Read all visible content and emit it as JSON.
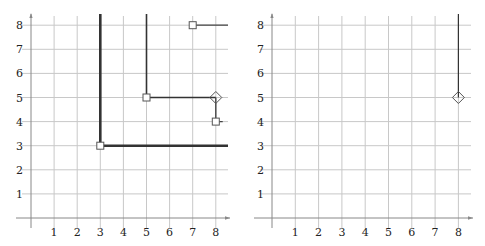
{
  "panels": [
    {
      "id": "left",
      "origin_px": [
        31,
        218
      ],
      "unit_px": [
        23.1,
        24.1
      ],
      "x_extent_px": [
        20,
        228
      ],
      "y_extent_px": [
        14,
        228
      ],
      "x_ticks": [
        "1",
        "2",
        "3",
        "4",
        "5",
        "6",
        "7",
        "8"
      ],
      "y_ticks": [
        "1",
        "2",
        "3",
        "4",
        "5",
        "6",
        "7",
        "8"
      ],
      "grid": {
        "xmax": 8.5,
        "ymax": 8.5
      },
      "paths": [
        {
          "name": "thick-corner-path-3-3",
          "points": [
            [
              3,
              8.5
            ],
            [
              3,
              3
            ],
            [
              8.5,
              3
            ]
          ],
          "width": 2.6,
          "color": "#333333"
        },
        {
          "name": "corner-path-5-5",
          "points": [
            [
              5,
              8.5
            ],
            [
              5,
              5
            ],
            [
              8,
              5
            ]
          ],
          "width": 1.6,
          "color": "#333333"
        },
        {
          "name": "path-7-8",
          "points": [
            [
              7,
              8
            ],
            [
              8.5,
              8
            ]
          ],
          "width": 1.2,
          "color": "#444444"
        },
        {
          "name": "path-8-5-to-8-4",
          "points": [
            [
              8,
              5
            ],
            [
              8,
              4
            ],
            [
              8.3,
              4
            ]
          ],
          "width": 1.4,
          "color": "#444444"
        }
      ],
      "squares": [
        [
          3,
          3
        ],
        [
          5,
          5
        ],
        [
          7,
          8
        ],
        [
          8,
          4
        ]
      ],
      "diamonds": [
        [
          8,
          5
        ]
      ]
    },
    {
      "id": "right",
      "origin_px": [
        272,
        218
      ],
      "unit_px": [
        23.3,
        24.1
      ],
      "x_extent_px": [
        258,
        471
      ],
      "y_extent_px": [
        14,
        228
      ],
      "x_ticks": [
        "1",
        "2",
        "3",
        "4",
        "5",
        "6",
        "7",
        "8"
      ],
      "y_ticks": [
        "1",
        "2",
        "3",
        "4",
        "5",
        "6",
        "7",
        "8"
      ],
      "grid": {
        "xmax": 8.5,
        "ymax": 8.5
      },
      "paths": [
        {
          "name": "vertical-path-8-5",
          "points": [
            [
              8,
              8.5
            ],
            [
              8,
              5
            ]
          ],
          "width": 1.2,
          "color": "#333333"
        }
      ],
      "squares": [],
      "diamonds": [
        [
          8,
          5
        ]
      ]
    }
  ],
  "colors": {
    "grid": "#c8c8c8",
    "axis": "#888888",
    "label": "#222222"
  }
}
